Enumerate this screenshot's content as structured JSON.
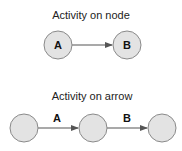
{
  "colors": {
    "node_fill": "#e3e3e3",
    "node_stroke": "#8a8a8a",
    "arrow": "#555555",
    "text": "#222222"
  },
  "diagrams": [
    {
      "title": "Activity on node",
      "nodes": [
        {
          "id": "A",
          "label": "A"
        },
        {
          "id": "B",
          "label": "B"
        }
      ],
      "edges": [
        {
          "from": "A",
          "to": "B",
          "label": ""
        }
      ]
    },
    {
      "title": "Activity on arrow",
      "nodes": [
        {
          "id": "n1",
          "label": ""
        },
        {
          "id": "n2",
          "label": ""
        },
        {
          "id": "n3",
          "label": ""
        }
      ],
      "edges": [
        {
          "from": "n1",
          "to": "n2",
          "label": "A"
        },
        {
          "from": "n2",
          "to": "n3",
          "label": "B"
        }
      ]
    }
  ]
}
